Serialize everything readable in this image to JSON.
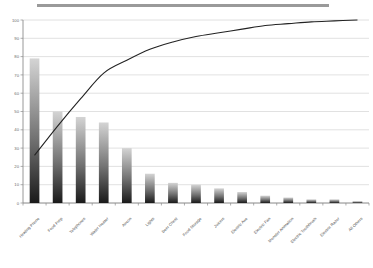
{
  "title_bar": {
    "visible": true,
    "color": "#9a9a9a",
    "text": ""
  },
  "axis": {
    "y_ticks": [
      "0",
      "10",
      "20",
      "30",
      "40",
      "50",
      "60",
      "70",
      "80",
      "90",
      "100"
    ],
    "y_min": 0,
    "y_max": 100,
    "tick_color": "#6b6b6b",
    "grid_color": "#c8c8c8"
  },
  "style": {
    "bar_top_color": "#d4d4d4",
    "bar_bottom_color": "#1a1a1a",
    "line_color": "#222222",
    "axis_line_color": "#8c8c8c",
    "background": "#ffffff"
  },
  "chart_data": {
    "type": "bar",
    "title": "",
    "subtitle": "",
    "xlabel": "",
    "ylabel": "",
    "ylim": [
      0,
      100
    ],
    "grid": true,
    "legend": false,
    "legend_position": "none",
    "categories": [
      "Heating Phone",
      "Food Prep",
      "Telephones",
      "Water Heater",
      "Aircon",
      "Lights",
      "Beer Chest",
      "Food Storage",
      "Juicers",
      "Electric Axe",
      "Electric Fan",
      "Monster Animation",
      "Electric Toothbrush",
      "Electric Razor",
      "All Others"
    ],
    "series": [
      {
        "name": "Frequency",
        "type": "bar",
        "values": [
          79,
          50,
          47,
          44,
          30,
          16,
          11,
          10,
          8,
          6,
          4,
          3,
          2,
          2,
          1
        ]
      },
      {
        "name": "Cumulative %",
        "type": "line",
        "values": [
          26,
          42,
          57,
          71,
          78,
          84,
          88,
          91,
          93,
          95,
          97,
          98,
          99,
          99.5,
          100
        ]
      }
    ]
  }
}
